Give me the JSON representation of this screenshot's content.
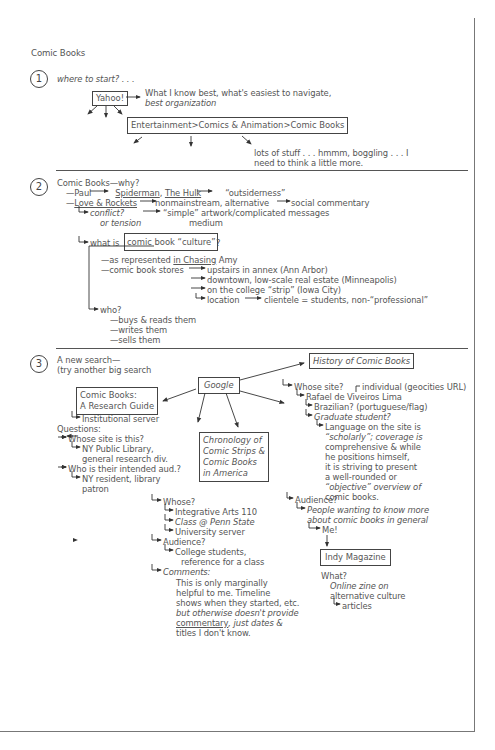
{
  "title": "Comic Books",
  "sections": {
    "s1": {
      "number": "1",
      "heading": "where to start? . . .",
      "yahoo_box": "Yahoo!",
      "yahoo_note": [
        "What I know best, what's easiest to navigate,",
        "best organization"
      ],
      "category_box": "Entertainment>Comics & Animation>Comic Books",
      "category_note": [
        "lots of stuff . . . hmmm, boggling . . . I",
        "need to think a little more."
      ]
    },
    "s2": {
      "number": "2",
      "heading": "Comic Books—why?",
      "paul_line": {
        "prefix": "—Paul",
        "spiderman": "Spiderman",
        "comma": ",",
        "hulk": "The Hulk",
        "result": "“outsiderness”"
      },
      "love_line": {
        "prefix": "—",
        "title": "Love & Rockets",
        "a": "nonmainstream, alternative",
        "b": "social commentary"
      },
      "conflict": {
        "a": "conflict?",
        "a2": "or tension",
        "b": "“simple” artwork/complicated messages",
        "b2": "medium"
      },
      "culture": {
        "prefix": "what is",
        "box": "comic book “culture”",
        "suffix": "?"
      },
      "represented": {
        "a": "—as represented ",
        "b": "in Chasing",
        "c": " Amy"
      },
      "stores_label": "—comic book stores",
      "stores": [
        "upstairs in annex (Ann Arbor)",
        "downtown, low-scale real estate (Minneapolis)",
        "on the college “strip” (Iowa City)",
        "location"
      ],
      "clientele": "clientele = students, non-“professional”",
      "who": "who?",
      "who_items": [
        "—buys & reads them",
        "—writes them",
        "—sells them"
      ]
    },
    "s3": {
      "number": "3",
      "heading": [
        "A new search—",
        "(try another big search"
      ],
      "google_box": "Google",
      "guide_box": [
        "Comic Books:",
        "A Research Guide"
      ],
      "guide_notes": {
        "server": "Institutional server",
        "questions": "Questions:",
        "q1": "Whose site is this?",
        "a1": [
          "NY Public Library,",
          "general research div."
        ],
        "q2": "Who is their intended aud.?",
        "a2": [
          "NY resident, library",
          "patron"
        ]
      },
      "chron_box": [
        "Chronology of",
        "Comic Strips &",
        "Comic Books",
        "in America"
      ],
      "chron_notes": {
        "whose": "Whose?",
        "whose_items": [
          "Integrative Arts 110",
          "Class @ Penn State",
          "University server"
        ],
        "audience": "Audience?",
        "audience_items": [
          "College students,",
          "reference for a class"
        ],
        "comments": "Comments:",
        "comment_lines": [
          "This is only marginally",
          "helpful to me. Timeline",
          "shows when they started, etc.",
          "but otherwise doesn't provide"
        ],
        "comment_u": "commentary",
        "comment_rest": ", just dates &",
        "comment_last": "titles I don't know."
      },
      "history_box": "History of Comic Books",
      "history_notes": {
        "whose": "Whose site?",
        "individual": "individual (geocities URL)",
        "name": "Rafael de Viveiros Lima",
        "brazilian": "Brazilian? (portuguese/flag)",
        "grad": "Graduate student?",
        "language": [
          "Language on the site is",
          "“scholarly”; coverage is",
          "comprehensive & while",
          "he positions himself,",
          "it is striving to present",
          "a well-rounded or",
          "“objective” overview of",
          "comic books."
        ],
        "audience": "Audience?",
        "audience_items": [
          "People wanting to know more",
          "about comic books in general"
        ],
        "me": "Me!"
      },
      "indy_box": "Indy Magazine",
      "indy_notes": {
        "what": "What?",
        "desc": [
          "Online zine on",
          "alternative culture"
        ],
        "articles": "articles"
      }
    }
  }
}
